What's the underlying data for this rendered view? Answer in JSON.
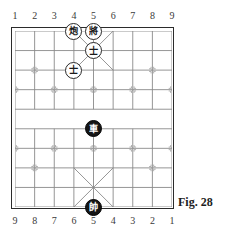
{
  "figure": {
    "caption": "Fig. 28"
  },
  "board": {
    "files": 9,
    "ranks": 10,
    "river_rank_gap": "between rank 4 and rank 5",
    "colors": {
      "frame": "#2b2b2b",
      "grid": "#8a8a8a",
      "palace_diagonal": "#8a8a8a",
      "star_point": "#9a9a9a",
      "piece_light_fill": "#ffffff",
      "piece_light_border": "#2a2a2a",
      "piece_dark_fill": "#151515",
      "piece_dark_text": "#ffffff",
      "background": "#ffffff"
    }
  },
  "coords_top": [
    "1",
    "2",
    "3",
    "4",
    "5",
    "6",
    "7",
    "8",
    "9"
  ],
  "coords_bottom": [
    "9",
    "8",
    "7",
    "6",
    "5",
    "4",
    "3",
    "2",
    "1"
  ],
  "pieces": [
    {
      "id": "piece-cannon-f4r0",
      "glyph": "炮",
      "name": "cannon",
      "side": "light",
      "file": 4,
      "rank": 0
    },
    {
      "id": "piece-general-f5r0",
      "glyph": "將",
      "name": "black-general",
      "side": "light",
      "file": 5,
      "rank": 0
    },
    {
      "id": "piece-advisor-f5r1",
      "glyph": "士",
      "name": "advisor",
      "side": "light",
      "file": 5,
      "rank": 1
    },
    {
      "id": "piece-advisor-f4r2",
      "glyph": "士",
      "name": "advisor",
      "side": "light",
      "file": 4,
      "rank": 2
    },
    {
      "id": "piece-chariot-f5r5",
      "glyph": "車",
      "name": "chariot",
      "side": "dark",
      "file": 5,
      "rank": 5
    },
    {
      "id": "piece-marshal-f5r9",
      "glyph": "帥",
      "name": "red-marshal",
      "side": "dark",
      "file": 5,
      "rank": 9
    }
  ],
  "star_points": [
    {
      "file": 2,
      "rank": 2
    },
    {
      "file": 8,
      "rank": 2
    },
    {
      "file": 1,
      "rank": 3
    },
    {
      "file": 3,
      "rank": 3
    },
    {
      "file": 5,
      "rank": 3
    },
    {
      "file": 7,
      "rank": 3
    },
    {
      "file": 9,
      "rank": 3
    },
    {
      "file": 1,
      "rank": 6
    },
    {
      "file": 3,
      "rank": 6
    },
    {
      "file": 5,
      "rank": 6
    },
    {
      "file": 7,
      "rank": 6
    },
    {
      "file": 9,
      "rank": 6
    },
    {
      "file": 2,
      "rank": 7
    },
    {
      "file": 8,
      "rank": 7
    }
  ]
}
